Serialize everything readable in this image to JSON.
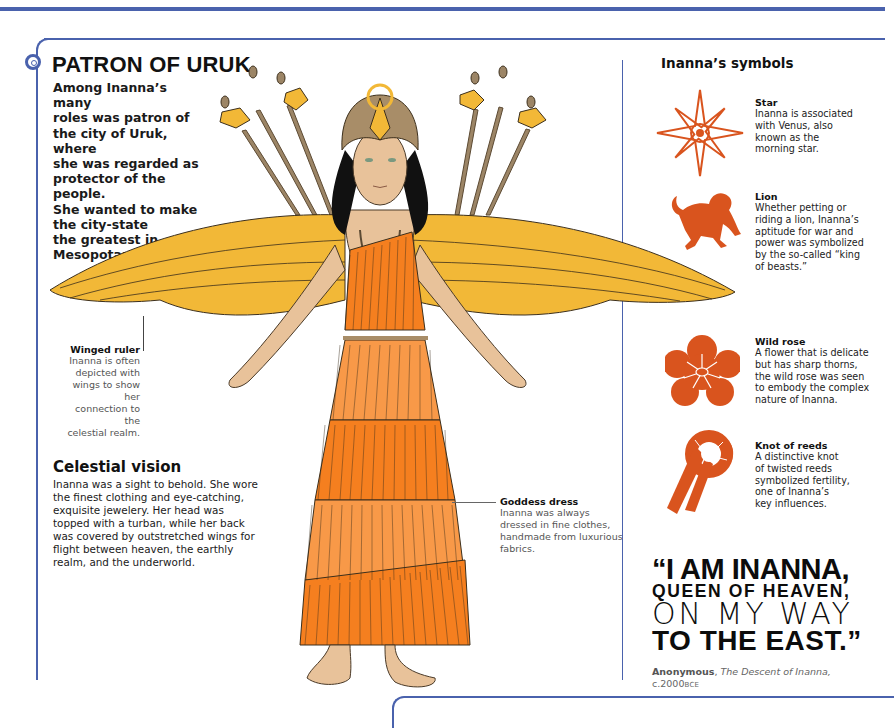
{
  "header": {
    "title": "PATRON OF URUK",
    "intro": "Among Inanna’s many roles was patron of the city of Uruk, where she was regarded as protector of the people. She wanted to make the city-state the greatest in Mesopotamia.",
    "intro_lines": [
      "Among Inanna’s many",
      "roles was patron of",
      "the city of Uruk, where",
      "she was regarded as",
      "protector of the people.",
      "She wanted to make",
      "the city-state",
      "the greatest in",
      "Mesopotamia."
    ]
  },
  "annotations": {
    "winged_ruler": {
      "title": "Winged ruler",
      "lines": [
        "Inanna is often",
        "depicted with",
        "wings to show her",
        "connection to the",
        "celestial realm."
      ]
    },
    "goddess_dress": {
      "title": "Goddess dress",
      "lines": [
        "Inanna was always",
        "dressed in fine clothes,",
        "handmade from luxurious",
        "fabrics."
      ]
    }
  },
  "celestial_vision": {
    "title": "Celestial vision",
    "lines": [
      "Inanna was a sight to behold. She wore",
      "the finest clothing and eye-catching,",
      "exquisite jewelery. Her head was",
      "topped with a turban, while her back",
      "was covered by outstretched wings for",
      "flight between heaven, the earthly",
      "realm, and the underworld."
    ]
  },
  "symbols": {
    "title": "Inanna’s symbols",
    "items": [
      {
        "icon": "star-icon",
        "title": "Star",
        "lines": [
          "Inanna is associated",
          "with Venus, also",
          "known as the",
          "morning star."
        ]
      },
      {
        "icon": "lion-icon",
        "title": "Lion",
        "lines": [
          "Whether petting or",
          "riding a lion, Inanna’s",
          "aptitude for war and",
          "power was symbolized",
          "by the so-called “king",
          "of beasts.”"
        ]
      },
      {
        "icon": "wild-rose-icon",
        "title": "Wild rose",
        "lines": [
          "A flower that is delicate",
          "but has sharp thorns,",
          "the wild rose was seen",
          "to embody the complex",
          "nature of Inanna."
        ]
      },
      {
        "icon": "knot-of-reeds-icon",
        "title": "Knot of reeds",
        "lines": [
          "A distinctive knot",
          "of twisted reeds",
          "symbolized fertility,",
          "one of Inanna’s",
          "key influences."
        ]
      }
    ]
  },
  "quote": {
    "line1": "“I AM INANNA,",
    "line2": "QUEEN OF HEAVEN,",
    "line3": "ON MY WAY",
    "line4": "TO THE EAST.”",
    "author": "Anonymous",
    "separator": ", ",
    "work": "The Descent of Inanna,",
    "date": "c.2000",
    "era": "BCE"
  },
  "colors": {
    "frame_blue": "#4a62ad",
    "symbol_orange": "#d9541e",
    "wing_gold": "#f2b837",
    "dress_orange": "#f57f1f",
    "skin": "#e8c29a"
  }
}
